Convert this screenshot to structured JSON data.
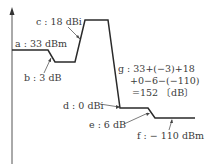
{
  "diagram": {
    "labels": {
      "a": "a : 33 dBm",
      "b": "b : 3 dB",
      "c": "c : 18 dBi",
      "d": "d : 0 dBi",
      "e": "e : 6 dB",
      "f": "f : − 110 dBm"
    },
    "calculation": {
      "line1": "g : 33+(−3)+18",
      "line2": "+0−6−(−110)",
      "line3": "=152 〔dB〕"
    },
    "values": {
      "transmit_power_dbm": 33,
      "tx_feeder_loss_db": 3,
      "tx_antenna_gain_dbi": 18,
      "rx_antenna_gain_dbi": 0,
      "rx_feeder_loss_db": 6,
      "receive_level_dbm": -110,
      "path_loss_db": 152
    },
    "colors": {
      "line": "#2a2a2a",
      "axis": "#555555",
      "text": "#3a3a3a"
    }
  }
}
